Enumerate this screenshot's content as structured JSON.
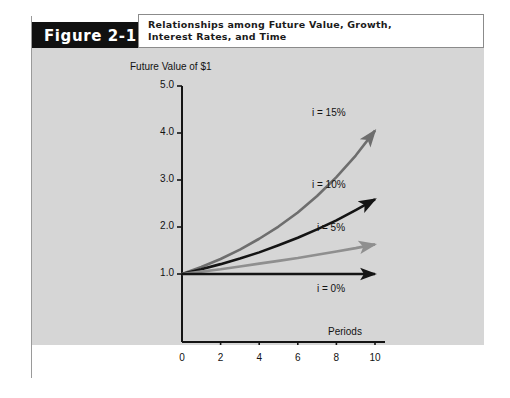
{
  "figure": {
    "tab_label": "Figure 2-1",
    "caption_line1": "Relationships among Future Value, Growth,",
    "caption_line2": "Interest Rates, and Time",
    "panel_color": "#d6d6d6",
    "tab_color": "#111111"
  },
  "chart_data": {
    "type": "line",
    "title": "Relationships among Future Value, Growth, Interest Rates, and Time",
    "xlabel": "Periods",
    "ylabel": "Future Value of $1",
    "xlim": [
      0,
      10
    ],
    "ylim": [
      0,
      5.0
    ],
    "grid": false,
    "legend": "inline-annotations",
    "x_ticks": [
      "0",
      "2",
      "4",
      "6",
      "8",
      "10"
    ],
    "x_tick_values": [
      0,
      2,
      4,
      6,
      8,
      10
    ],
    "y_ticks": [
      "1.0",
      "2.0",
      "3.0",
      "4.0",
      "5.0"
    ],
    "y_tick_values": [
      1.0,
      2.0,
      3.0,
      4.0,
      5.0
    ],
    "x": [
      0,
      1,
      2,
      3,
      4,
      5,
      6,
      7,
      8,
      9,
      10
    ],
    "series": [
      {
        "name": "i = 15%",
        "label": "i = 15%",
        "color": "#6e6e6e",
        "values": [
          1.0,
          1.15,
          1.32,
          1.52,
          1.75,
          2.01,
          2.31,
          2.66,
          3.06,
          3.52,
          4.05
        ],
        "label_x": 10,
        "label_y": 4.05
      },
      {
        "name": "i = 10%",
        "label": "i = 10%",
        "color": "#141414",
        "values": [
          1.0,
          1.1,
          1.21,
          1.33,
          1.46,
          1.61,
          1.77,
          1.95,
          2.14,
          2.36,
          2.59
        ],
        "label_x": 10,
        "label_y": 2.59
      },
      {
        "name": "i = 5%",
        "label": "i = 5%",
        "color": "#8f8f8f",
        "values": [
          1.0,
          1.05,
          1.1,
          1.16,
          1.22,
          1.28,
          1.34,
          1.41,
          1.48,
          1.55,
          1.63
        ],
        "label_x": 10,
        "label_y": 1.63
      },
      {
        "name": "i = 0%",
        "label": "i = 0%",
        "color": "#141414",
        "values": [
          1.0,
          1.0,
          1.0,
          1.0,
          1.0,
          1.0,
          1.0,
          1.0,
          1.0,
          1.0,
          1.0
        ],
        "label_x": 10,
        "label_y": 1.0
      }
    ],
    "annotations": [
      {
        "text": "i = 15%",
        "name": "curve-label-15"
      },
      {
        "text": "i = 10%",
        "name": "curve-label-10"
      },
      {
        "text": "i = 5%",
        "name": "curve-label-5"
      },
      {
        "text": "i = 0%",
        "name": "curve-label-0"
      }
    ]
  }
}
